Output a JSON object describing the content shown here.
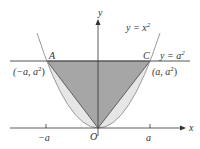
{
  "diagram": {
    "axes": {
      "x_label": "x",
      "y_label": "y",
      "origin_label": "O"
    },
    "curve_label": "y = x",
    "curve_exp": "2",
    "line_label": "y = a",
    "line_exp": "2",
    "points": {
      "A": {
        "name": "A",
        "coord": "(−a, a",
        "coord_end": ")"
      },
      "C": {
        "name": "C",
        "coord": "(a, a",
        "coord_end": ")"
      }
    },
    "ticks": {
      "neg": "−a",
      "pos": "a"
    },
    "sup2": "2",
    "colors": {
      "triangle": "#a6a6a6",
      "region": "#e6e6e6",
      "curve": "#9a9a9a",
      "axis": "#333333",
      "line": "#555555"
    }
  }
}
